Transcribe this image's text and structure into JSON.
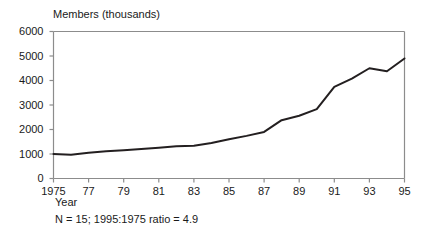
{
  "chart_data": {
    "type": "line",
    "title": "Members (thousands)",
    "xlabel": "Year",
    "ylabel": "",
    "xlim": [
      1975,
      1995
    ],
    "ylim": [
      0,
      6000
    ],
    "grid": false,
    "legend": "none",
    "annotation": "N = 15; 1995:1975 ratio = 4.9",
    "ytick_labels": [
      "6000",
      "5000",
      "4000",
      "3000",
      "2000",
      "1000",
      "0"
    ],
    "ytick_values": [
      6000,
      5000,
      4000,
      3000,
      2000,
      1000,
      0
    ],
    "xtick_labels": [
      "1975",
      "77",
      "79",
      "81",
      "83",
      "85",
      "87",
      "89",
      "91",
      "93",
      "95"
    ],
    "xtick_values": [
      1975,
      1977,
      1979,
      1981,
      1983,
      1985,
      1987,
      1989,
      1991,
      1993,
      1995
    ],
    "x": [
      1975,
      1976,
      1977,
      1978,
      1979,
      1980,
      1981,
      1982,
      1983,
      1984,
      1985,
      1986,
      1987,
      1988,
      1989,
      1990,
      1991,
      1992,
      1993,
      1994,
      1995
    ],
    "values": [
      1000,
      970,
      1050,
      1110,
      1150,
      1200,
      1260,
      1320,
      1340,
      1450,
      1600,
      1740,
      1900,
      2380,
      2560,
      2830,
      3740,
      4080,
      4500,
      4380,
      4900
    ],
    "series_name": "Members",
    "line_color": "#231f20",
    "axis_color": "#8c8c8c"
  },
  "labels": {
    "chart_title": "Members (thousands)",
    "x_axis_name": "Year",
    "footnote": "N = 15; 1995:1975 ratio = 4.9"
  }
}
